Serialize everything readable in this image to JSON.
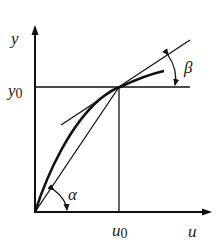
{
  "diagram": {
    "axes": {
      "x_label": "u",
      "y_label": "y"
    },
    "operating_point": {
      "x_label_base": "u",
      "x_label_sub": "0",
      "y_label_base": "y",
      "y_label_sub": "0"
    },
    "angles": {
      "chord_angle": "α",
      "tangent_angle": "β"
    },
    "colors": {
      "stroke": "#111111",
      "background": "#ffffff"
    }
  }
}
